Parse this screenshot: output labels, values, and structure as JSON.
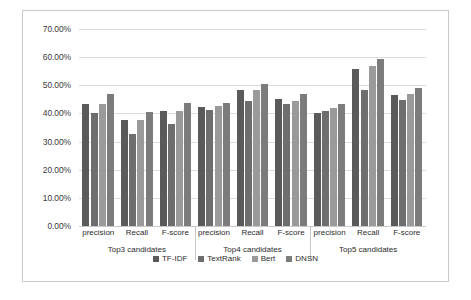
{
  "chart_data": {
    "type": "bar",
    "title": "",
    "xlabel": "",
    "ylabel": "",
    "ylim": [
      0,
      70
    ],
    "grid": true,
    "legend_position": "bottom",
    "y_ticks": [
      "0.00%",
      "10.00%",
      "20.00%",
      "30.00%",
      "40.00%",
      "50.00%",
      "60.00%",
      "70.00%"
    ],
    "y_tick_values": [
      0,
      10,
      20,
      30,
      40,
      50,
      60,
      70
    ],
    "categories": [
      "precision",
      "Recall",
      "F-score",
      "precision",
      "Recall",
      "F-score",
      "precision",
      "Recall",
      "F-score"
    ],
    "groups": [
      {
        "label": "Top3 candidates",
        "categories": [
          "precision",
          "Recall",
          "F-score"
        ]
      },
      {
        "label": "Top4 candidates",
        "categories": [
          "precision",
          "Recall",
          "F-score"
        ]
      },
      {
        "label": "Top5 candidates",
        "categories": [
          "precision",
          "Recall",
          "F-score"
        ]
      }
    ],
    "series": [
      {
        "name": "TF-IDF",
        "color": "#5a5a5a",
        "values": [
          43.2,
          37.5,
          40.7,
          42.2,
          48.2,
          45.3,
          40.3,
          55.8,
          46.5
        ]
      },
      {
        "name": "TextRank",
        "color": "#6e6e6e",
        "values": [
          40.3,
          32.6,
          36.1,
          41.4,
          44.3,
          43.4,
          40.7,
          48.2,
          44.6
        ]
      },
      {
        "name": "Bert",
        "color": "#9a9a9a",
        "values": [
          43.4,
          37.8,
          41.0,
          42.8,
          48.4,
          44.5,
          41.9,
          57.0,
          46.8
        ]
      },
      {
        "name": "DNSN",
        "color": "#7c7c7c",
        "values": [
          47.0,
          40.5,
          43.7,
          43.8,
          50.4,
          46.8,
          43.2,
          59.5,
          49.2
        ]
      }
    ]
  },
  "legend": {
    "items": [
      {
        "label": "TF-IDF"
      },
      {
        "label": "TextRank"
      },
      {
        "label": "Bert"
      },
      {
        "label": "DNSN"
      }
    ]
  }
}
